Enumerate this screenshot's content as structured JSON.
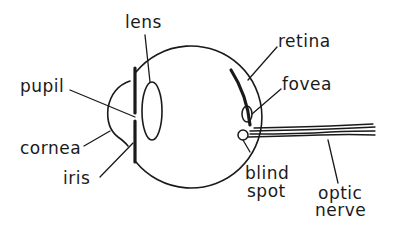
{
  "diagram": {
    "colors": {
      "ink": "#1a1a1a",
      "background": "#ffffff"
    },
    "labels": {
      "lens": "lens",
      "pupil": "pupil",
      "cornea": "cornea",
      "iris": "iris",
      "retina": "retina",
      "fovea": "fovea",
      "blind_spot_line1": "blind",
      "blind_spot_line2": "spot",
      "optic_nerve_line1": "optic",
      "optic_nerve_line2": "nerve"
    }
  }
}
